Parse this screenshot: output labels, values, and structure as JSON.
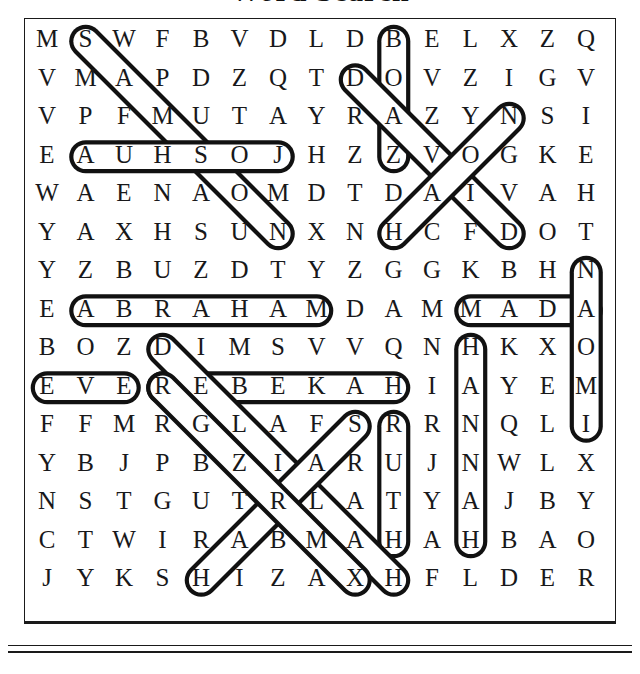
{
  "page": {
    "title_partial": "Word Search",
    "puzzle_type": "word-search",
    "rows": 15,
    "cols": 15,
    "ink_color": "#18181a",
    "background": "#ffffff"
  },
  "grid": {
    "letters": [
      [
        "M",
        "S",
        "W",
        "F",
        "B",
        "V",
        "D",
        "L",
        "D",
        "B",
        "E",
        "L",
        "X",
        "Z",
        "Q"
      ],
      [
        "V",
        "M",
        "A",
        "P",
        "D",
        "Z",
        "Q",
        "T",
        "D",
        "O",
        "V",
        "Z",
        "I",
        "G",
        "V"
      ],
      [
        "V",
        "P",
        "F",
        "M",
        "U",
        "T",
        "A",
        "Y",
        "R",
        "A",
        "Z",
        "Y",
        "N",
        "S",
        "I"
      ],
      [
        "E",
        "A",
        "U",
        "H",
        "S",
        "O",
        "J",
        "H",
        "Z",
        "Z",
        "V",
        "O",
        "G",
        "K",
        "E"
      ],
      [
        "W",
        "A",
        "E",
        "N",
        "A",
        "O",
        "M",
        "D",
        "T",
        "D",
        "A",
        "I",
        "V",
        "A",
        "H"
      ],
      [
        "Y",
        "A",
        "X",
        "H",
        "S",
        "U",
        "N",
        "X",
        "N",
        "H",
        "C",
        "F",
        "D",
        "O",
        "T"
      ],
      [
        "Y",
        "Z",
        "B",
        "U",
        "Z",
        "D",
        "T",
        "Y",
        "Z",
        "G",
        "G",
        "K",
        "B",
        "H",
        "N"
      ],
      [
        "E",
        "A",
        "B",
        "R",
        "A",
        "H",
        "A",
        "M",
        "D",
        "A",
        "M",
        "M",
        "A",
        "D",
        "A"
      ],
      [
        "B",
        "O",
        "Z",
        "D",
        "I",
        "M",
        "S",
        "V",
        "V",
        "Q",
        "N",
        "H",
        "K",
        "X",
        "O"
      ],
      [
        "E",
        "V",
        "E",
        "R",
        "E",
        "B",
        "E",
        "K",
        "A",
        "H",
        "I",
        "A",
        "Y",
        "E",
        "M"
      ],
      [
        "F",
        "F",
        "M",
        "R",
        "G",
        "L",
        "A",
        "F",
        "S",
        "R",
        "R",
        "N",
        "Q",
        "L",
        "I"
      ],
      [
        "Y",
        "B",
        "J",
        "P",
        "B",
        "Z",
        "I",
        "A",
        "R",
        "U",
        "J",
        "N",
        "W",
        "L",
        "X"
      ],
      [
        "N",
        "S",
        "T",
        "G",
        "U",
        "T",
        "R",
        "L",
        "A",
        "T",
        "Y",
        "A",
        "J",
        "B",
        "Y"
      ],
      [
        "C",
        "T",
        "W",
        "I",
        "R",
        "A",
        "B",
        "M",
        "A",
        "H",
        "A",
        "H",
        "B",
        "A",
        "O"
      ],
      [
        "J",
        "Y",
        "K",
        "S",
        "H",
        "I",
        "Z",
        "A",
        "X",
        "H",
        "F",
        "L",
        "D",
        "E",
        "R"
      ]
    ]
  },
  "found_words": [
    {
      "word": "SAMSON",
      "shape": "diagonal",
      "start_row": 1,
      "start_col": 2,
      "end_row": 6,
      "end_col": 7,
      "reversed": false
    },
    {
      "word": "JOSHUA",
      "shape": "horizontal",
      "start_row": 4,
      "start_col": 7,
      "end_row": 4,
      "end_col": 2,
      "reversed": true
    },
    {
      "word": "BOAZ",
      "shape": "vertical",
      "start_row": 1,
      "start_col": 10,
      "end_row": 4,
      "end_col": 10,
      "reversed": false
    },
    {
      "word": "DAVID",
      "shape": "diagonal",
      "start_row": 2,
      "start_col": 9,
      "end_row": 6,
      "end_col": 13,
      "reversed": false
    },
    {
      "word": "NOAH",
      "shape": "diagonal",
      "start_row": 3,
      "start_col": 13,
      "end_row": 6,
      "end_col": 10,
      "reversed": true
    },
    {
      "word": "ABRAHAM",
      "shape": "horizontal",
      "start_row": 8,
      "start_col": 2,
      "end_row": 8,
      "end_col": 8,
      "reversed": false
    },
    {
      "word": "ADAM",
      "shape": "horizontal",
      "start_row": 8,
      "start_col": 15,
      "end_row": 8,
      "end_col": 12,
      "reversed": true
    },
    {
      "word": "NAOMI",
      "shape": "vertical",
      "start_row": 7,
      "start_col": 15,
      "end_row": 11,
      "end_col": 15,
      "reversed": false
    },
    {
      "word": "EVE",
      "shape": "horizontal",
      "start_row": 10,
      "start_col": 1,
      "end_row": 10,
      "end_col": 3,
      "reversed": false
    },
    {
      "word": "REBEKAH",
      "shape": "horizontal",
      "start_row": 10,
      "start_col": 4,
      "end_row": 10,
      "end_col": 10,
      "reversed": false
    },
    {
      "word": "HANNAH",
      "shape": "vertical",
      "start_row": 9,
      "start_col": 12,
      "end_row": 14,
      "end_col": 12,
      "reversed": false
    },
    {
      "word": "RUTH",
      "shape": "vertical",
      "start_row": 11,
      "start_col": 10,
      "end_row": 14,
      "end_col": 10,
      "reversed": false
    },
    {
      "word": "DELILAH",
      "shape": "diagonal",
      "start_row": 9,
      "start_col": 4,
      "end_row": 15,
      "end_col": 10,
      "reversed": false
    },
    {
      "word": "SARAH",
      "shape": "diagonal",
      "start_row": 11,
      "start_col": 9,
      "end_row": 15,
      "end_col": 5,
      "reversed": true
    },
    {
      "word": "RAHAB",
      "shape": "diagonal",
      "start_row": 10,
      "start_col": 4,
      "end_row": 15,
      "end_col": 9,
      "reversed": false
    }
  ],
  "marks": {
    "cell_size": 38.5,
    "origin_x": 28,
    "origin_y": 22,
    "stroke": "#111111",
    "stroke_width": 4.2
  }
}
